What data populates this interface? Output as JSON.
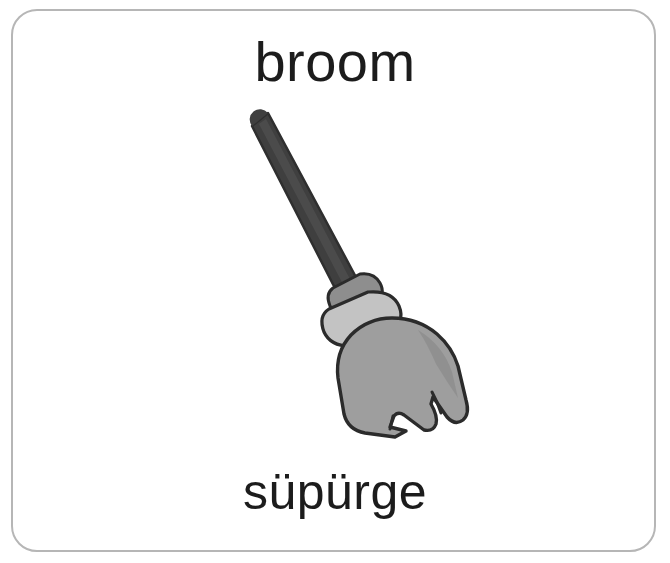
{
  "card": {
    "type": "vocabulary-flashcard",
    "border_color": "#b6b6b6",
    "background_color": "#ffffff",
    "english_word": "broom",
    "turkish_word": "süpürge",
    "illustration_name": "broom-illustration"
  },
  "illustration": {
    "subject": "broom",
    "style": "grayscale-clipart",
    "handle_color": "#3f3f3f",
    "handle_shadow_color": "#565656",
    "collar_upper_color": "#8e8e8e",
    "collar_lower_color": "#c3c3c3",
    "bristle_color": "#9e9e9e",
    "bristle_shade_color": "#8a8a8a",
    "outline_color": "#2b2b2b"
  },
  "colors": {
    "text": "#1c1c1c",
    "border": "#b6b6b6",
    "page_background": "#ffffff"
  }
}
